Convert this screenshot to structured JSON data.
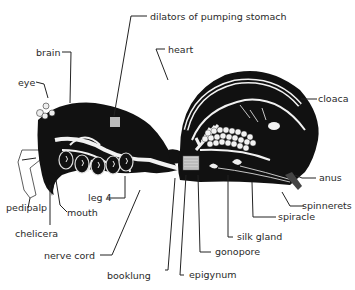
{
  "diagram": {
    "labels": {
      "dilators": "dilators of pumping stomach",
      "heart": "heart",
      "brain": "brain",
      "eye": "eye",
      "cloaca": "cloaca",
      "anus": "anus",
      "spinnerets": "spinnerets",
      "spiracle": "spiracle",
      "silk_gland": "silk gland",
      "gonopore": "gonopore",
      "epigynum": "epigynum",
      "booklung": "booklung",
      "nerve_cord": "nerve cord",
      "leg4": "leg 4",
      "mouth": "mouth",
      "chelicera": "chelicera",
      "pedipalp": "pedipalp"
    },
    "colors": {
      "ink": "#111111",
      "background": "#ffffff",
      "highlight": "#f2f2f2"
    }
  }
}
